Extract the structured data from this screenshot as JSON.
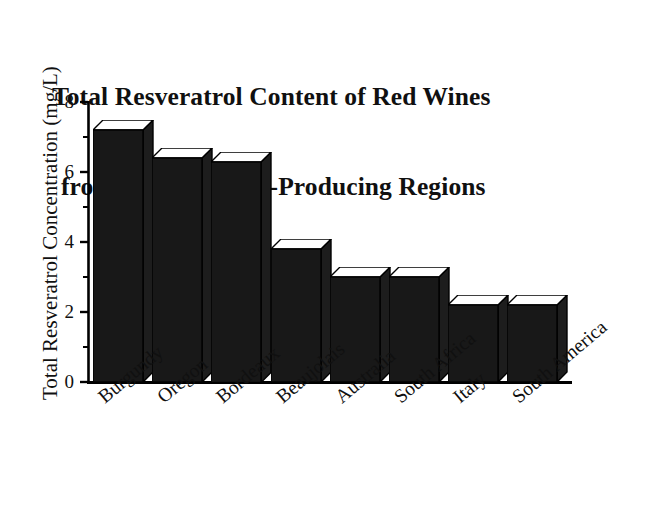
{
  "chart_data": {
    "type": "bar",
    "title": "Total Resveratrol Content of Red Wines from Various Wine-Producing Regions",
    "title_line1": "Total Resveratrol Content of Red Wines",
    "title_line2": "from Various Wine-Producing Regions",
    "xlabel": "",
    "ylabel": "Total Resveratrol Concentration (mg/L)",
    "ylim": [
      0,
      8
    ],
    "ytick_labels": [
      "0",
      "2",
      "4",
      "6",
      "8"
    ],
    "ytick_values": [
      0,
      2,
      4,
      6,
      8
    ],
    "minor_tick_values": [
      1,
      3,
      5,
      7
    ],
    "grid": false,
    "legend": "none",
    "bar_style": "3d-extruded-black",
    "categories": [
      "Burgundy",
      "Oregon",
      "Bordeaux",
      "Beaujolais",
      "Australia",
      "South Africa",
      "Italy",
      "South America"
    ],
    "values": [
      7.2,
      6.4,
      6.3,
      3.8,
      3.0,
      3.0,
      2.2,
      2.2
    ],
    "units": "mg/L"
  },
  "colors": {
    "bar_fill": "#181818",
    "bar_top": "#ffffff",
    "bar_side": "#1d1d1d",
    "axis": "#000000",
    "background": "#ffffff",
    "text": "#101010"
  }
}
